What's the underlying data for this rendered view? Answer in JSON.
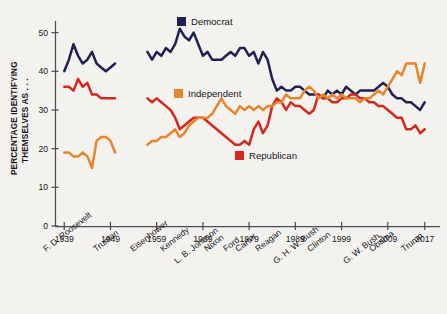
{
  "axes": {
    "ylabel_line1": "PERCENTAGE IDENTIFYING",
    "ylabel_line2": "THEMSELVES AS . . .",
    "y_ticks": [
      "0",
      "10",
      "20",
      "30",
      "40",
      "50"
    ],
    "x_ticks": [
      "1939",
      "1949",
      "1959",
      "1969",
      "1979",
      "1989",
      "1999",
      "2009",
      "2017"
    ],
    "presidents": [
      "F. D. Roosevelt",
      "Truman",
      "Eisenhower",
      "Kennedy",
      "L. B. Johnson",
      "Nixon",
      "Ford",
      "Carter",
      "Reagan",
      "G. H. W. Bush",
      "Clinton",
      "G. W. Bush",
      "Obama",
      "Trump"
    ]
  },
  "legend": [
    {
      "label": "Democrat",
      "color": "#1f2152"
    },
    {
      "label": "Independent",
      "color": "#e8842c"
    },
    {
      "label": "Republican",
      "color": "#d4281e"
    }
  ],
  "colors": {
    "democrat": "#1f2152",
    "independent": "#e8842c",
    "republican": "#d4281e",
    "axis": "#4c4c52",
    "background": "#f4f2ee",
    "text": "#16161a"
  },
  "chart_data": {
    "type": "line",
    "title": "",
    "xlabel": "",
    "ylabel": "PERCENTAGE IDENTIFYING THEMSELVES AS . . .",
    "xlim": [
      1937,
      2019
    ],
    "ylim": [
      0,
      53
    ],
    "y_ticks": [
      0,
      10,
      20,
      30,
      40,
      50
    ],
    "x_ticks": [
      1939,
      1949,
      1959,
      1969,
      1979,
      1989,
      1999,
      2009,
      2017
    ],
    "grid": false,
    "legend_position": "inside",
    "note": "Gallup party identification. Independent series has no data 1950-1956; all series break between 1950 and 1957.",
    "series": [
      {
        "name": "Democrat",
        "color": "#1f2152",
        "segments": [
          {
            "x": [
              1939,
              1940,
              1941,
              1942,
              1943,
              1944,
              1945,
              1946,
              1947,
              1948,
              1949,
              1950
            ],
            "y": [
              40,
              43,
              47,
              44,
              42,
              43,
              45,
              42,
              41,
              40,
              41,
              42
            ]
          },
          {
            "x": [
              1957,
              1958,
              1959,
              1960,
              1961,
              1962,
              1963,
              1964,
              1965,
              1966,
              1967,
              1968,
              1969,
              1970,
              1971,
              1972,
              1973,
              1974,
              1975,
              1976,
              1977,
              1978,
              1979,
              1980,
              1981,
              1982,
              1983,
              1984,
              1985,
              1986,
              1987,
              1988,
              1989,
              1990,
              1991,
              1992,
              1993,
              1994,
              1995,
              1996,
              1997,
              1998,
              1999,
              2000,
              2001,
              2002,
              2003,
              2004,
              2005,
              2006,
              2007,
              2008,
              2009,
              2010,
              2011,
              2012,
              2013,
              2014,
              2015,
              2016,
              2017
            ],
            "y": [
              45,
              43,
              45,
              44,
              46,
              45,
              47,
              51,
              49,
              48,
              50,
              47,
              44,
              45,
              43,
              43,
              43,
              44,
              45,
              44,
              46,
              46,
              44,
              45,
              42,
              45,
              43,
              38,
              35,
              36,
              35,
              35,
              36,
              36,
              35,
              34,
              34,
              34,
              33,
              35,
              34,
              35,
              34,
              36,
              35,
              34,
              35,
              35,
              35,
              35,
              36,
              37,
              36,
              34,
              33,
              33,
              32,
              32,
              31,
              30,
              32
            ]
          }
        ]
      },
      {
        "name": "Republican",
        "color": "#d4281e",
        "segments": [
          {
            "x": [
              1939,
              1940,
              1941,
              1942,
              1943,
              1944,
              1945,
              1946,
              1947,
              1948,
              1949,
              1950
            ],
            "y": [
              36,
              36,
              35,
              38,
              36,
              37,
              34,
              34,
              33,
              33,
              33,
              33
            ]
          },
          {
            "x": [
              1957,
              1958,
              1959,
              1960,
              1961,
              1962,
              1963,
              1964,
              1965,
              1966,
              1967,
              1968,
              1969,
              1970,
              1971,
              1972,
              1973,
              1974,
              1975,
              1976,
              1977,
              1978,
              1979,
              1980,
              1981,
              1982,
              1983,
              1984,
              1985,
              1986,
              1987,
              1988,
              1989,
              1990,
              1991,
              1992,
              1993,
              1994,
              1995,
              1996,
              1997,
              1998,
              1999,
              2000,
              2001,
              2002,
              2003,
              2004,
              2005,
              2006,
              2007,
              2008,
              2009,
              2010,
              2011,
              2012,
              2013,
              2014,
              2015,
              2016,
              2017
            ],
            "y": [
              33,
              32,
              33,
              32,
              31,
              30,
              28,
              25,
              26,
              27,
              28,
              28,
              28,
              27,
              26,
              25,
              24,
              23,
              22,
              21,
              21,
              22,
              21,
              25,
              27,
              24,
              26,
              31,
              33,
              32,
              30,
              32,
              31,
              31,
              30,
              29,
              30,
              34,
              33,
              33,
              32,
              32,
              33,
              33,
              34,
              34,
              33,
              33,
              32,
              32,
              31,
              31,
              30,
              29,
              28,
              28,
              25,
              25,
              26,
              24,
              25
            ]
          }
        ]
      },
      {
        "name": "Independent",
        "color": "#e8842c",
        "segments": [
          {
            "x": [
              1939,
              1940,
              1941,
              1942,
              1943,
              1944,
              1945,
              1946,
              1947,
              1948,
              1949,
              1950
            ],
            "y": [
              19,
              19,
              18,
              18,
              19,
              18,
              15,
              22,
              23,
              23,
              22,
              19
            ]
          },
          {
            "x": [
              1957,
              1958,
              1959,
              1960,
              1961,
              1962,
              1963,
              1964,
              1965,
              1966,
              1967,
              1968,
              1969,
              1970,
              1971,
              1972,
              1973,
              1974,
              1975,
              1976,
              1977,
              1978,
              1979,
              1980,
              1981,
              1982,
              1983,
              1984,
              1985,
              1986,
              1987,
              1988,
              1989,
              1990,
              1991,
              1992,
              1993,
              1994,
              1995,
              1996,
              1997,
              1998,
              1999,
              2000,
              2001,
              2002,
              2003,
              2004,
              2005,
              2006,
              2007,
              2008,
              2009,
              2010,
              2011,
              2012,
              2013,
              2014,
              2015,
              2016,
              2017
            ],
            "y": [
              21,
              22,
              22,
              23,
              23,
              24,
              25,
              23,
              24,
              26,
              27,
              28,
              28,
              28,
              29,
              31,
              33,
              31,
              30,
              29,
              31,
              30,
              31,
              30,
              31,
              30,
              31,
              31,
              32,
              32,
              34,
              33,
              33,
              33,
              35,
              36,
              35,
              33,
              34,
              33,
              34,
              33,
              34,
              33,
              33,
              33,
              32,
              33,
              33,
              34,
              35,
              34,
              36,
              38,
              40,
              39,
              42,
              42,
              42,
              37,
              42
            ]
          }
        ]
      }
    ]
  },
  "legend_positions": [
    {
      "key": "democrat",
      "sw_x": 177,
      "sw_y": 17,
      "tx": 191,
      "ty": 25
    },
    {
      "key": "independent",
      "sw_x": 174,
      "sw_y": 89,
      "tx": 188,
      "ty": 97
    },
    {
      "key": "republican",
      "sw_x": 235,
      "sw_y": 151,
      "tx": 249,
      "ty": 159
    }
  ]
}
